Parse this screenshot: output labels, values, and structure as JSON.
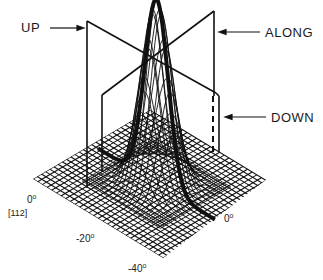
{
  "diagram": {
    "type": "3d-surface-with-planes",
    "labels": {
      "up": "UP",
      "along": "ALONG",
      "down": "DOWN"
    },
    "axis_ticks": {
      "left_zero": "0",
      "direction": "[112]",
      "minus20": "-20",
      "minus40": "-40",
      "right_zero": "0"
    },
    "degree_symbol": "o",
    "colors": {
      "line": "#111111",
      "background": "#ffffff"
    }
  }
}
